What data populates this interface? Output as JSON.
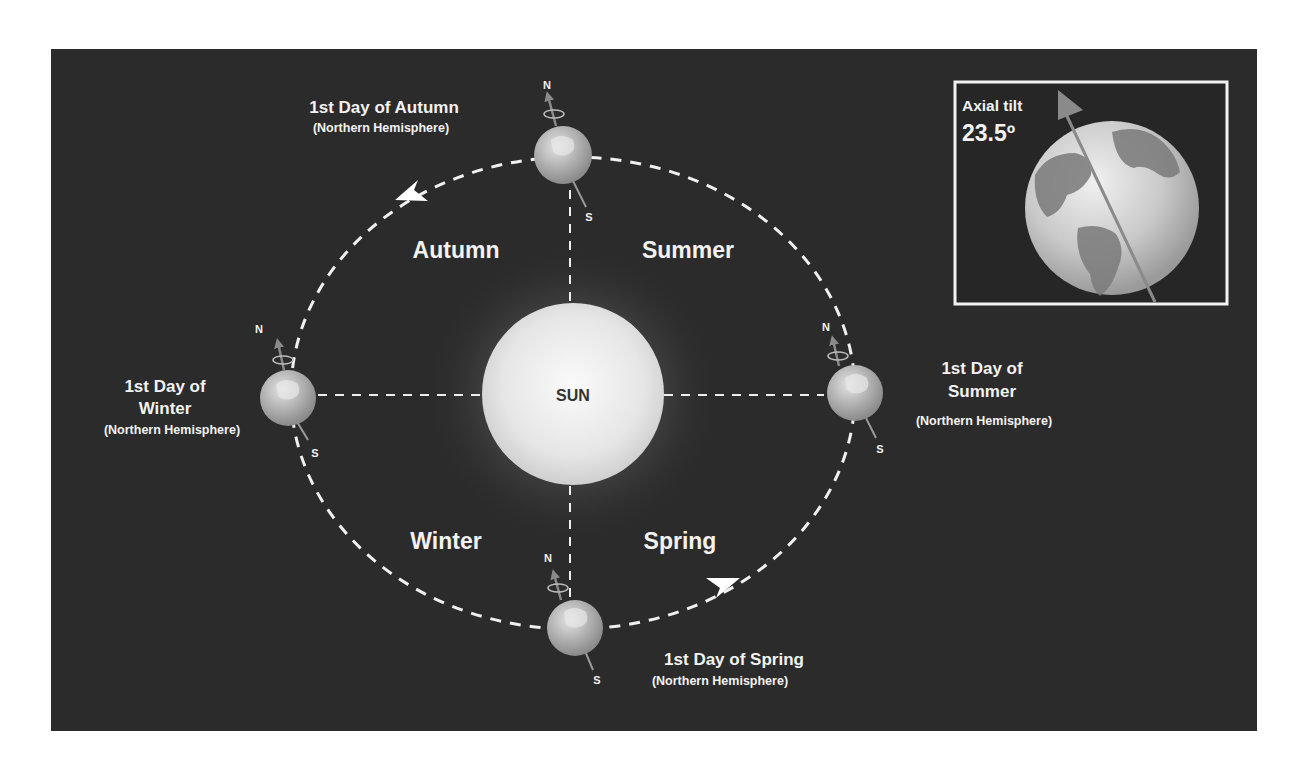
{
  "colors": {
    "background": "#ffffff",
    "panel": "#2b2b2b",
    "text": "#f2f2f2",
    "orbit_dash": "#f0f0f0",
    "sun_core": "#f4f4f4",
    "sun_edge": "#d4d4d4",
    "earth_light": "#d8d8d8",
    "earth_dark": "#8e8e8e",
    "axis_arrow": "#8a8a8a",
    "sun_label": "#333333"
  },
  "sun": {
    "label": "SUN"
  },
  "seasons": [
    {
      "id": "autumn",
      "label": "Autumn"
    },
    {
      "id": "summer",
      "label": "Summer"
    },
    {
      "id": "winter",
      "label": "Winter"
    },
    {
      "id": "spring",
      "label": "Spring"
    }
  ],
  "positions": [
    {
      "id": "autumn-equinox",
      "line1": "1st Day of Autumn",
      "line2": "",
      "sub": "(Northern Hemisphere)",
      "north": "N",
      "south": "S"
    },
    {
      "id": "winter-solstice",
      "line1": "1st Day of",
      "line2": "Winter",
      "sub": "(Northern Hemisphere)",
      "north": "N",
      "south": "S"
    },
    {
      "id": "summer-solstice",
      "line1": "1st Day of",
      "line2": "Summer",
      "sub": "(Northern Hemisphere)",
      "north": "N",
      "south": "S"
    },
    {
      "id": "spring-equinox",
      "line1": "1st Day of Spring",
      "line2": "",
      "sub": "(Northern Hemisphere)",
      "north": "N",
      "south": "S"
    }
  ],
  "inset": {
    "label": "Axial tilt",
    "value": "23.5º"
  },
  "orbit_direction": "counterclockwise"
}
